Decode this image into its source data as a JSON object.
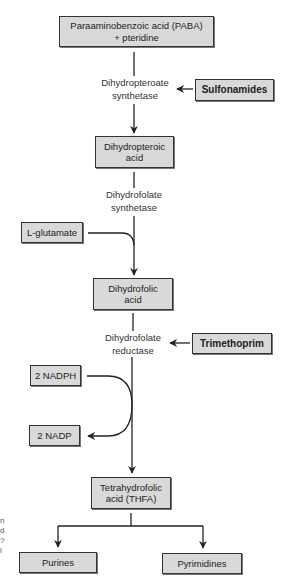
{
  "diagram": {
    "nodes": {
      "paba": {
        "label_line1": "Paraaminobenzoic acid (PABA)",
        "label_line2": "+ pteridine"
      },
      "dihydropteroic": {
        "label_line1": "Dihydropteroic",
        "label_line2": "acid"
      },
      "dihydrofolic": {
        "label_line1": "Dihydrofolic",
        "label_line2": "acid"
      },
      "thfa": {
        "label_line1": "Tetrahydrofolic",
        "label_line2": "acid (THFA)"
      },
      "purines": {
        "label": "Purines"
      },
      "pyrimidines": {
        "label": "Pyrimidines"
      },
      "l_glutamate": {
        "label": "L-glutamate"
      },
      "nadph": {
        "label": "2 NADPH"
      },
      "nadp": {
        "label": "2 NADP"
      }
    },
    "enzymes": {
      "dihydropteroate_synthetase": {
        "line1": "Dihydropteroate",
        "line2": "synthetase"
      },
      "dihydrofolate_synthetase": {
        "line1": "Dihydrofolate",
        "line2": "synthetase"
      },
      "dihydrofolate_reductase": {
        "line1": "Dihydrofolate",
        "line2": "reductase"
      }
    },
    "inhibitors": {
      "sulfonamides": {
        "label": "Sulfonamides",
        "target": "Dihydropteroate synthetase"
      },
      "trimethoprim": {
        "label": "Trimethoprim",
        "target": "Dihydrofolate reductase"
      }
    },
    "edges": [
      {
        "from": "PABA + pteridine",
        "to": "Dihydropteroic acid",
        "via": "Dihydropteroate synthetase"
      },
      {
        "from": "Dihydropteroic acid",
        "to": "Dihydrofolic acid",
        "via": "Dihydrofolate synthetase",
        "cofactor_in": "L-glutamate"
      },
      {
        "from": "Dihydrofolic acid",
        "to": "Tetrahydrofolic acid (THFA)",
        "via": "Dihydrofolate reductase",
        "cofactor_in": "2 NADPH",
        "cofactor_out": "2 NADP"
      },
      {
        "from": "Tetrahydrofolic acid (THFA)",
        "to": "Purines"
      },
      {
        "from": "Tetrahydrofolic acid (THFA)",
        "to": "Pyrimidines"
      },
      {
        "from": "Sulfonamides",
        "to": "Dihydropteroate synthetase",
        "type": "inhibition"
      },
      {
        "from": "Trimethoprim",
        "to": "Dihydrofolate reductase",
        "type": "inhibition"
      }
    ],
    "colors": {
      "box_fill": "#d9d9d9",
      "box_border": "#333333",
      "line": "#222222",
      "background": "#ffffff"
    },
    "margin_fragment": {
      "chars": "n\nd\n?\nl"
    }
  }
}
